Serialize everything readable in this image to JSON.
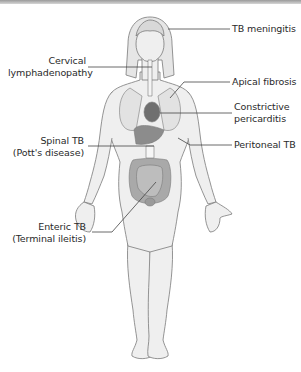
{
  "figure": {
    "colors": {
      "skin_fill": "#efefef",
      "outline": "#7a7a7a",
      "organ_fill": "#a9a9a9",
      "organ_dark": "#8c8c8c",
      "heart": "#6f6f6f",
      "leader_line": "#444444",
      "text": "#2a2a2a"
    }
  },
  "labels": {
    "tb_meningitis": {
      "line1": "TB meningitis"
    },
    "cervical": {
      "line1": "Cervical",
      "line2": "lymphadenopathy"
    },
    "apical": {
      "line1": "Apical fibrosis"
    },
    "constrictive": {
      "line1": "Constrictive",
      "line2": "pericarditis"
    },
    "spinal": {
      "line1": "Spinal TB",
      "line2": "(Pott's disease)"
    },
    "peritoneal": {
      "line1": "Peritoneal TB"
    },
    "enteric": {
      "line1": "Enteric TB",
      "line2": "(Terminal ileitis)"
    }
  }
}
